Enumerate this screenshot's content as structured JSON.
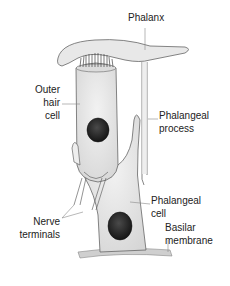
{
  "diagram": {
    "type": "anatomical-illustration",
    "labels": {
      "phalanx": "Phalanx",
      "outer_hair_cell_1": "Outer",
      "outer_hair_cell_2": "hair",
      "outer_hair_cell_3": "cell",
      "phalangeal_process_1": "Phalangeal",
      "phalangeal_process_2": "process",
      "phalangeal_cell_1": "Phalangeal",
      "phalangeal_cell_2": "cell",
      "nerve_terminals_1": "Nerve",
      "nerve_terminals_2": "terminals",
      "basilar_membrane_1": "Basilar",
      "basilar_membrane_2": "membrane"
    },
    "colors": {
      "background": "#ffffff",
      "outline": "#555555",
      "cell_fill": "#e6e6e6",
      "nucleus": "#2a2a2a",
      "leader_line": "#888888",
      "text": "#222222"
    }
  }
}
